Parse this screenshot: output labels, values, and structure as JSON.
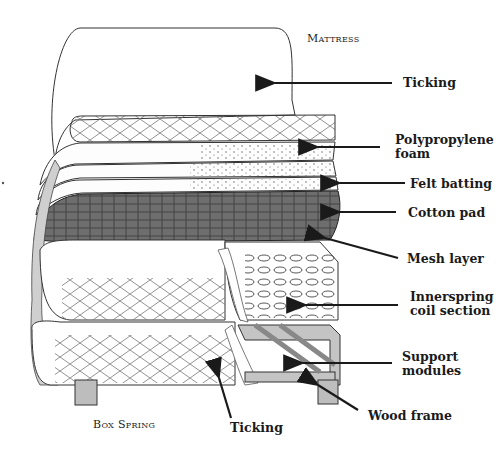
{
  "diagram": {
    "sections": [
      {
        "id": "mattress",
        "label": "Mattress"
      },
      {
        "id": "box_spring",
        "label": "Box Spring"
      }
    ],
    "labels": {
      "ticking_top": "Ticking",
      "polypropylene_foam_1": "Polypropylene",
      "polypropylene_foam_2": "foam",
      "felt_batting": "Felt batting",
      "cotton_pad": "Cotton pad",
      "mesh_layer": "Mesh layer",
      "innerspring_1": "Innerspring",
      "innerspring_2": "coil section",
      "support_modules_1": "Support",
      "support_modules_2": "modules",
      "wood_frame": "Wood frame",
      "ticking_bottom": "Ticking"
    },
    "colors": {
      "ink": "#1a1a1a",
      "cotton_pad": "#6b6b6b",
      "wood": "#b8b8b8",
      "background": "#ffffff"
    }
  }
}
